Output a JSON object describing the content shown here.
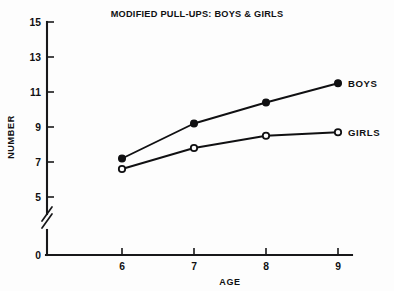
{
  "chart_data": {
    "type": "line",
    "title": "MODIFIED PULL-UPS: BOYS & GIRLS",
    "xlabel": "AGE",
    "ylabel": "NUMBER",
    "x": [
      6,
      7,
      8,
      9
    ],
    "xtick_labels": [
      "6",
      "7",
      "8",
      "9"
    ],
    "ytick_labels": [
      "0",
      "5",
      "7",
      "9",
      "11",
      "13",
      "15"
    ],
    "ytick_values": [
      0,
      5,
      7,
      9,
      11,
      13,
      15
    ],
    "xlim": [
      5.5,
      9.4
    ],
    "ylim": [
      0,
      15
    ],
    "axis_break": true,
    "axis_break_between": [
      0,
      5
    ],
    "grid": false,
    "legend": "inline-right-labels",
    "series": [
      {
        "name": "BOYS",
        "label": "BOYS",
        "marker": "filled-circle",
        "values": [
          7.2,
          9.2,
          10.4,
          11.5
        ]
      },
      {
        "name": "GIRLS",
        "label": "GIRLS",
        "marker": "open-circle",
        "values": [
          6.6,
          7.8,
          8.5,
          8.7
        ]
      }
    ],
    "colors": {
      "ink": "#101012",
      "background": "#fdfdfd"
    }
  }
}
